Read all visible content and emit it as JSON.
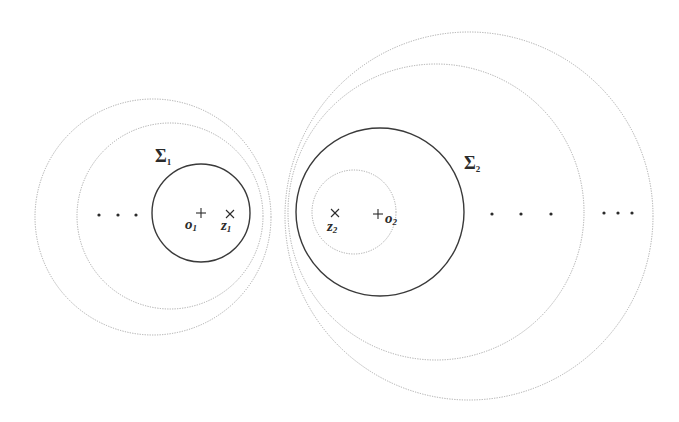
{
  "figure": {
    "left_group": {
      "curve_label": "Σ",
      "curve_sub": "1",
      "center_label": "o",
      "center_sub": "1",
      "point_label": "z",
      "point_sub": "1",
      "ellipsis": "· · ·"
    },
    "right_group": {
      "curve_label": "Σ",
      "curve_sub": "2",
      "center_label": "o",
      "center_sub": "2",
      "point_label": "z",
      "point_sub": "2",
      "ellipsis_near": "· · ·",
      "ellipsis_far": "· · ·"
    },
    "colors": {
      "solid": "#3a3a3a",
      "dotted": "#a8a8a8",
      "marks": "#2b2b2b"
    }
  }
}
